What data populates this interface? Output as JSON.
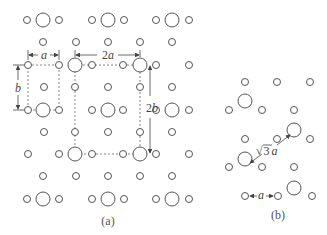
{
  "diagram": {
    "panels": [
      {
        "id": "a",
        "caption": "(a)",
        "description": "Rectangular surface lattice with unit cells a×b (primitive) and 2a×2b (reconstructed)",
        "annotations": {
          "a_label": "a",
          "b_label": "b",
          "two_a_label": "2a",
          "two_b_label": "2b"
        }
      },
      {
        "id": "b",
        "caption": "(b)",
        "description": "Hexagonal surface lattice with spacing a and superstructure spacing √3 a",
        "annotations": {
          "a_label": "a",
          "sqrt3_symbol": "√",
          "sqrt3_value": "3",
          "sqrt3_a": "a"
        }
      }
    ],
    "legend": {
      "large_circle": "adsorbate/large atom",
      "small_circle": "substrate/small atom"
    }
  }
}
